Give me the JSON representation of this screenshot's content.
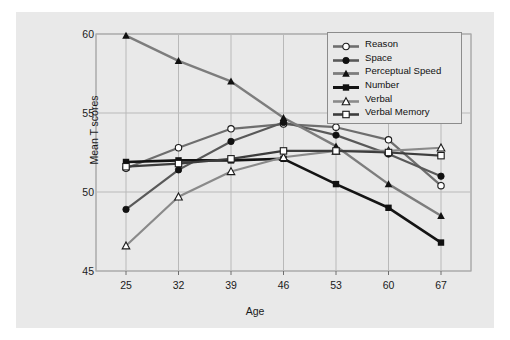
{
  "figure": {
    "background_color": "#e9e9e9",
    "plot_border_color": "#8c8c8c",
    "gridline_color": "#b9b9b9"
  },
  "chart_data": {
    "type": "line",
    "title": "",
    "xlabel": "Age",
    "ylabel": "Mean T scores",
    "categories": [
      "25",
      "32",
      "39",
      "46",
      "53",
      "60",
      "67"
    ],
    "x": [
      25,
      32,
      39,
      46,
      53,
      60,
      67
    ],
    "xlim": [
      21,
      71
    ],
    "ylim": [
      45,
      60
    ],
    "yticks": [
      "45",
      "50",
      "55",
      "60"
    ],
    "ytick_values": [
      45,
      50,
      55,
      60
    ],
    "xticks": [
      "25",
      "32",
      "39",
      "46",
      "53",
      "60",
      "67"
    ],
    "grid": true,
    "legend_position": "top-right",
    "series": [
      {
        "name": "Reason",
        "color": "#6e6e6e",
        "marker": "open-circle",
        "linewidth": 2.2,
        "values": [
          51.5,
          52.8,
          54.0,
          54.3,
          54.1,
          53.3,
          50.4
        ]
      },
      {
        "name": "Space",
        "color": "#595959",
        "marker": "filled-circle",
        "linewidth": 2.2,
        "values": [
          48.9,
          51.4,
          53.2,
          54.4,
          53.6,
          52.4,
          51.0
        ]
      },
      {
        "name": "Perceptual Speed",
        "color": "#7d7d7d",
        "marker": "filled-triangle",
        "linewidth": 2.4,
        "values": [
          59.9,
          58.3,
          57.0,
          54.7,
          52.9,
          50.5,
          48.5
        ]
      },
      {
        "name": "Number",
        "color": "#141414",
        "marker": "filled-square",
        "linewidth": 2.6,
        "values": [
          51.9,
          52.0,
          52.0,
          52.1,
          50.5,
          49.0,
          46.8
        ]
      },
      {
        "name": "Verbal",
        "color": "#8a8a8a",
        "marker": "open-triangle",
        "linewidth": 2.2,
        "values": [
          46.6,
          49.7,
          51.3,
          52.2,
          52.6,
          52.6,
          52.8
        ]
      },
      {
        "name": "Verbal Memory",
        "color": "#3d3d3d",
        "marker": "open-square",
        "linewidth": 2.2,
        "values": [
          51.6,
          51.8,
          52.1,
          52.6,
          52.6,
          52.5,
          52.3
        ]
      }
    ]
  },
  "legend": {
    "entries": [
      {
        "label": "Reason"
      },
      {
        "label": "Space"
      },
      {
        "label": "Perceptual Speed"
      },
      {
        "label": "Number"
      },
      {
        "label": "Verbal"
      },
      {
        "label": "Verbal Memory"
      }
    ]
  }
}
